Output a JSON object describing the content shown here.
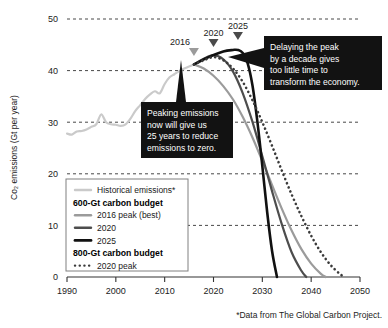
{
  "chart_data": {
    "type": "line",
    "title": "",
    "xlabel": "",
    "ylabel": "Co₂ emissions (Gt per year)",
    "xlim": [
      1990,
      2050
    ],
    "ylim": [
      0,
      50
    ],
    "grid": true,
    "x_ticks": [
      "1990",
      "2000",
      "2010",
      "2020",
      "2030",
      "2040",
      "2050"
    ],
    "y_ticks": [
      "0",
      "10",
      "20",
      "30",
      "40",
      "50"
    ],
    "legend_position": "lower-left-inside",
    "series": [
      {
        "name": "Historical emissions*",
        "style": "solid",
        "color": "#cacaca",
        "width": 2.2,
        "x": [
          1990,
          1991,
          1992,
          1993,
          1994,
          1995,
          1996,
          1997,
          1998,
          1999,
          2000,
          2001,
          2002,
          2003,
          2004,
          2005,
          2006,
          2007,
          2008,
          2009,
          2010,
          2011,
          2012,
          2013,
          2014,
          2015,
          2016
        ],
        "values": [
          27.8,
          27.6,
          28.2,
          28.3,
          28.6,
          29.1,
          29.6,
          31.5,
          30.0,
          29.6,
          29.5,
          29.3,
          29.6,
          30.7,
          32.2,
          33.3,
          34.5,
          35.4,
          36.0,
          35.6,
          37.4,
          38.7,
          39.3,
          39.9,
          40.4,
          40.8,
          41.2
        ]
      },
      {
        "name": "2016 peak (best)",
        "budget": "600-Gt carbon budget",
        "style": "solid",
        "color": "#9b9b9b",
        "width": 2.2,
        "peak_year": 2016,
        "peak_value": 41.2,
        "zero_year": 2043,
        "x": [
          2016,
          2018,
          2020,
          2022,
          2024,
          2026,
          2028,
          2030,
          2032,
          2034,
          2036,
          2038,
          2040,
          2042,
          2043
        ],
        "values": [
          41.2,
          40.4,
          39.0,
          37.0,
          34.4,
          31.0,
          27.0,
          22.5,
          17.8,
          13.2,
          9.0,
          5.4,
          2.6,
          0.6,
          0.0
        ]
      },
      {
        "name": "2020",
        "budget": "600-Gt carbon budget",
        "style": "solid",
        "color": "#4d4d4d",
        "width": 2.2,
        "peak_year": 2020,
        "peak_value": 43.0,
        "zero_year": 2039,
        "x": [
          2016,
          2018,
          2020,
          2022,
          2024,
          2026,
          2028,
          2030,
          2032,
          2034,
          2036,
          2038,
          2039
        ],
        "values": [
          41.2,
          42.3,
          43.0,
          42.2,
          39.8,
          35.6,
          30.0,
          23.4,
          16.6,
          10.2,
          4.8,
          1.2,
          0.0
        ]
      },
      {
        "name": "2025",
        "budget": "600-Gt carbon budget",
        "style": "solid",
        "color": "#111111",
        "width": 2.6,
        "peak_year": 2025,
        "peak_value": 44.0,
        "zero_year": 2033,
        "x": [
          2016,
          2019,
          2022,
          2024,
          2025,
          2026,
          2027,
          2028,
          2029,
          2030,
          2031,
          2032,
          2033
        ],
        "values": [
          41.2,
          42.6,
          43.7,
          44.0,
          44.0,
          43.4,
          41.4,
          37.0,
          30.0,
          21.5,
          12.5,
          5.0,
          0.0
        ]
      },
      {
        "name": "2020 peak",
        "budget": "800-Gt carbon budget",
        "style": "dotted",
        "color": "#3a3a3a",
        "width": 2.6,
        "peak_year": 2020,
        "peak_value": 42.6,
        "zero_year": 2047,
        "x": [
          2016,
          2018,
          2020,
          2022,
          2024,
          2026,
          2028,
          2030,
          2032,
          2034,
          2036,
          2038,
          2040,
          2042,
          2044,
          2046,
          2047
        ],
        "values": [
          41.2,
          42.0,
          42.6,
          42.0,
          40.4,
          37.8,
          34.2,
          30.0,
          25.4,
          20.6,
          16.0,
          11.8,
          8.0,
          4.8,
          2.3,
          0.5,
          0.0
        ]
      }
    ],
    "markers": [
      {
        "label": "2016",
        "year": 2016,
        "value": 41.2
      },
      {
        "label": "2020",
        "year": 2020,
        "value": 43.0
      },
      {
        "label": "2025",
        "year": 2025,
        "value": 44.0
      }
    ],
    "annotations": [
      {
        "id": "peaking-now",
        "lines": [
          "Peaking emissions",
          "now will give us",
          "25 years to reduce",
          "emissions to zero."
        ],
        "points_to_year": 2015
      },
      {
        "id": "delaying-peak",
        "lines": [
          "Delaying the peak",
          "by a decade gives",
          "too little time to",
          "transform the economy."
        ],
        "points_to_year": 2025
      }
    ],
    "legend": [
      {
        "kind": "item",
        "label": "Historical emissions*",
        "swatch": "solid",
        "color": "#cacaca"
      },
      {
        "kind": "header",
        "label": "600-Gt carbon budget"
      },
      {
        "kind": "item",
        "label": "2016 peak (best)",
        "swatch": "solid",
        "color": "#9b9b9b"
      },
      {
        "kind": "item",
        "label": "2020",
        "swatch": "solid",
        "color": "#4d4d4d"
      },
      {
        "kind": "item",
        "label": "2025",
        "swatch": "solid",
        "color": "#111111"
      },
      {
        "kind": "header",
        "label": "800-Gt carbon budget"
      },
      {
        "kind": "item",
        "label": "2020 peak",
        "swatch": "dotted",
        "color": "#3a3a3a"
      }
    ],
    "source_note": "*Data from The Global Carbon Project."
  }
}
